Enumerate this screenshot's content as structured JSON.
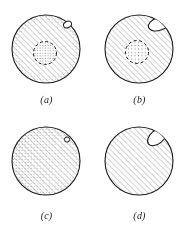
{
  "figure": {
    "background_color": "#ffffff",
    "ink_color": "#1b1b1b",
    "hatch_color": "#9a9a9a",
    "stipple_color": "#6e6e6e",
    "columns": 2,
    "rows": 2,
    "panels": [
      {
        "id": "a",
        "caption": "(a)",
        "outline_shape": "circle",
        "fill_pattern": "diagonal-hatch",
        "hatch_angle_deg": 45,
        "rim_texture": "stipple-full",
        "inner_feature": {
          "shape": "circle",
          "outline": "dashed",
          "fill_pattern": "stipple-dense",
          "position": "center"
        },
        "surface_feature": {
          "shape": "oval",
          "fill": "white",
          "size": "tiny",
          "position": "upper-right-rim"
        }
      },
      {
        "id": "b",
        "caption": "(b)",
        "outline_shape": "circle",
        "fill_pattern": "diagonal-hatch",
        "hatch_angle_deg": 45,
        "rim_texture": "none",
        "inner_feature": {
          "shape": "circle",
          "outline": "dashed",
          "fill_pattern": "stipple-sparse",
          "position": "center"
        },
        "surface_feature": {
          "shape": "oval",
          "fill": "white",
          "size": "large",
          "position": "upper-right-rim"
        }
      },
      {
        "id": "c",
        "caption": "(c)",
        "outline_shape": "circle",
        "fill_pattern": "diagonal-hatch",
        "hatch_angle_deg": 45,
        "rim_texture": "stipple-partial",
        "inner_feature": null,
        "surface_feature": {
          "shape": "circle",
          "fill": "white",
          "size": "tiny",
          "position": "upper-right-rim"
        }
      },
      {
        "id": "d",
        "caption": "(d)",
        "outline_shape": "circle",
        "fill_pattern": "diagonal-hatch",
        "hatch_angle_deg": 45,
        "rim_texture": "none",
        "inner_feature": null,
        "surface_feature": {
          "shape": "oval",
          "fill": "white",
          "size": "large",
          "position": "upper-right-rim"
        }
      }
    ]
  }
}
